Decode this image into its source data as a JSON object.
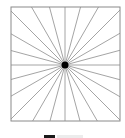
{
  "figure": {
    "type": "starburst",
    "square": {
      "x": 11,
      "y": 7,
      "width": 109,
      "height": 114
    },
    "center": {
      "x": 65,
      "y": 65
    },
    "spoke_count": 24,
    "spoke_angle_step_deg": 15,
    "colors": {
      "frame": "#8a8a8a",
      "spokes": "#9a9a9a",
      "center_dot": "#000000",
      "background": "#ffffff"
    },
    "center_dot_radius": 3.5
  },
  "caption": {
    "clipped": true
  }
}
